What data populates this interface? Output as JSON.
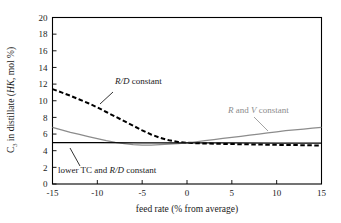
{
  "chart_data": {
    "type": "line",
    "title": "",
    "xlabel": "feed rate (% from average)",
    "ylabel": "C3 in distillate (HK, mol %)",
    "ylabel_parts": {
      "prefix": "C",
      "subscript": "3",
      "middle": " in distillate (",
      "italic": "HK",
      "suffix": ", mol %)"
    },
    "xlim": [
      -15,
      15
    ],
    "ylim": [
      0,
      20
    ],
    "xticks": [
      -15,
      -10,
      -5,
      0,
      5,
      10,
      15
    ],
    "xtick_labels": [
      "-15",
      "-10",
      "-5",
      "0",
      "5",
      "10",
      "15"
    ],
    "yticks": [
      0,
      2,
      4,
      6,
      8,
      10,
      12,
      14,
      16,
      18,
      20
    ],
    "ytick_labels": [
      "0",
      "2",
      "4",
      "6",
      "8",
      "10",
      "12",
      "14",
      "16",
      "18",
      "20"
    ],
    "grid": false,
    "legend_position": "inline-annotations",
    "series": [
      {
        "name": "R/D constant",
        "style": "dashed",
        "color": "#000000",
        "x": [
          -15,
          -14,
          -13,
          -12,
          -11,
          -10,
          -9,
          -8,
          -7,
          -6,
          -5,
          -4,
          -3,
          -2,
          -1,
          0,
          1,
          2,
          3,
          4,
          5,
          6,
          7,
          8,
          9,
          10,
          11,
          12,
          13,
          14,
          15
        ],
        "values": [
          11.4,
          11.0,
          10.6,
          10.15,
          9.7,
          9.2,
          8.65,
          8.1,
          7.55,
          7.0,
          6.45,
          5.95,
          5.55,
          5.25,
          5.05,
          4.95,
          4.9,
          4.87,
          4.84,
          4.82,
          4.8,
          4.78,
          4.76,
          4.74,
          4.72,
          4.7,
          4.69,
          4.68,
          4.66,
          4.64,
          4.62
        ]
      },
      {
        "name": "R and V constant",
        "style": "solid",
        "color": "#8c8c8c",
        "x": [
          -15,
          -14,
          -13,
          -12,
          -11,
          -10,
          -9,
          -8,
          -7,
          -6,
          -5,
          -4,
          -3,
          -2,
          -1,
          0,
          1,
          2,
          3,
          4,
          5,
          6,
          7,
          8,
          9,
          10,
          11,
          12,
          13,
          14,
          15
        ],
        "values": [
          6.8,
          6.5,
          6.2,
          5.95,
          5.7,
          5.45,
          5.2,
          5.0,
          4.85,
          4.72,
          4.67,
          4.68,
          4.72,
          4.78,
          4.85,
          4.95,
          5.07,
          5.2,
          5.33,
          5.47,
          5.6,
          5.73,
          5.87,
          6.0,
          6.13,
          6.27,
          6.4,
          6.5,
          6.6,
          6.7,
          6.8
        ]
      },
      {
        "name": "lower TC and R/D constant",
        "style": "solid",
        "color": "#000000",
        "x": [
          -15,
          -10,
          -5,
          0,
          5,
          10,
          15
        ],
        "values": [
          4.97,
          4.96,
          4.95,
          4.94,
          4.93,
          4.92,
          4.9
        ]
      }
    ],
    "annotations": [
      {
        "id": "rd-constant",
        "text_plain": "R/D constant",
        "italic_part": "R/D",
        "plain_part": " constant",
        "color": "#000000",
        "x_px": 115,
        "y_px": 84
      },
      {
        "id": "r-and-v-constant",
        "text_plain": "R and V constant",
        "color": "#8c8c8c",
        "segments": [
          "R",
          " and ",
          "V",
          " constant"
        ],
        "x_px": 228,
        "y_px": 113
      },
      {
        "id": "lower-tc-and-rd-constant",
        "text_plain": "lower TC and R/D constant",
        "plain_lead": "lower TC and ",
        "italic_part": "R/D",
        "plain_tail": " constant",
        "color": "#000000",
        "x_px": 58,
        "y_px": 173
      }
    ]
  },
  "figure": {
    "background": "#ffffff",
    "frame_color": "#000000",
    "accent_gray": "#8c8c8c"
  }
}
